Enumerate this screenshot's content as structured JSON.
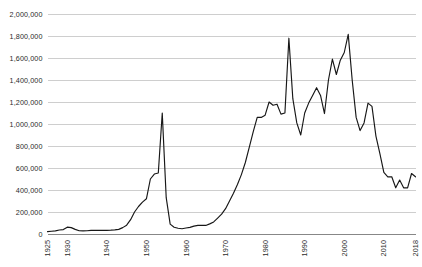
{
  "chart_data": {
    "type": "line",
    "title": "",
    "subtitle": "",
    "xlabel": "",
    "ylabel": "",
    "grid": true,
    "legend": false,
    "legend_position": "none",
    "line_color": "#171717",
    "grid_color": "#c9c9c9",
    "axis_color": "#7a7a7a",
    "background_color": "#ffffff",
    "xlim": [
      1925,
      2018
    ],
    "ylim": [
      0,
      2000000
    ],
    "y_ticks": [
      0,
      200000,
      400000,
      600000,
      800000,
      1000000,
      1200000,
      1400000,
      1600000,
      1800000,
      2000000
    ],
    "y_tick_labels": [
      "0",
      "200,000",
      "400,000",
      "600,000",
      "800,000",
      "1,000,000",
      "1,200,000",
      "1,400,000",
      "1,600,000",
      "1,800,000",
      "2,000,000"
    ],
    "x_ticks": [
      1925,
      1930,
      1940,
      1950,
      1960,
      1970,
      1980,
      1990,
      2000,
      2010,
      2018
    ],
    "x_tick_labels": [
      "1925",
      "1930",
      "1940",
      "1950",
      "1960",
      "1970",
      "1980",
      "1990",
      "2000",
      "2010",
      "2018"
    ],
    "x": [
      1925,
      1926,
      1927,
      1928,
      1929,
      1930,
      1931,
      1932,
      1933,
      1934,
      1935,
      1936,
      1937,
      1938,
      1939,
      1940,
      1941,
      1942,
      1943,
      1944,
      1945,
      1946,
      1947,
      1948,
      1949,
      1950,
      1951,
      1952,
      1953,
      1954,
      1955,
      1956,
      1957,
      1958,
      1959,
      1960,
      1961,
      1962,
      1963,
      1964,
      1965,
      1966,
      1967,
      1968,
      1969,
      1970,
      1971,
      1972,
      1973,
      1974,
      1975,
      1976,
      1977,
      1978,
      1979,
      1980,
      1981,
      1982,
      1983,
      1984,
      1985,
      1986,
      1987,
      1988,
      1989,
      1990,
      1991,
      1992,
      1993,
      1994,
      1995,
      1996,
      1997,
      1998,
      1999,
      2000,
      2001,
      2002,
      2003,
      2004,
      2005,
      2006,
      2007,
      2008,
      2009,
      2010,
      2011,
      2012,
      2013,
      2014,
      2015,
      2016,
      2017,
      2018
    ],
    "y": [
      22000,
      25000,
      28000,
      36000,
      40000,
      62000,
      58000,
      42000,
      30000,
      28000,
      30000,
      33000,
      34000,
      33000,
      33000,
      33000,
      35000,
      38000,
      42000,
      58000,
      80000,
      130000,
      200000,
      250000,
      290000,
      320000,
      500000,
      545000,
      555000,
      1100000,
      330000,
      90000,
      62000,
      52000,
      48000,
      55000,
      60000,
      72000,
      78000,
      80000,
      78000,
      92000,
      110000,
      145000,
      180000,
      230000,
      300000,
      370000,
      450000,
      540000,
      650000,
      790000,
      930000,
      1060000,
      1060000,
      1080000,
      1200000,
      1170000,
      1180000,
      1090000,
      1100000,
      1780000,
      1230000,
      1010000,
      900000,
      1100000,
      1190000,
      1260000,
      1330000,
      1260000,
      1095000,
      1400000,
      1590000,
      1450000,
      1580000,
      1650000,
      1815000,
      1400000,
      1060000,
      940000,
      1010000,
      1190000,
      1160000,
      890000,
      730000,
      560000,
      520000,
      520000,
      420000,
      490000,
      420000,
      420000,
      550000,
      520000
    ]
  }
}
